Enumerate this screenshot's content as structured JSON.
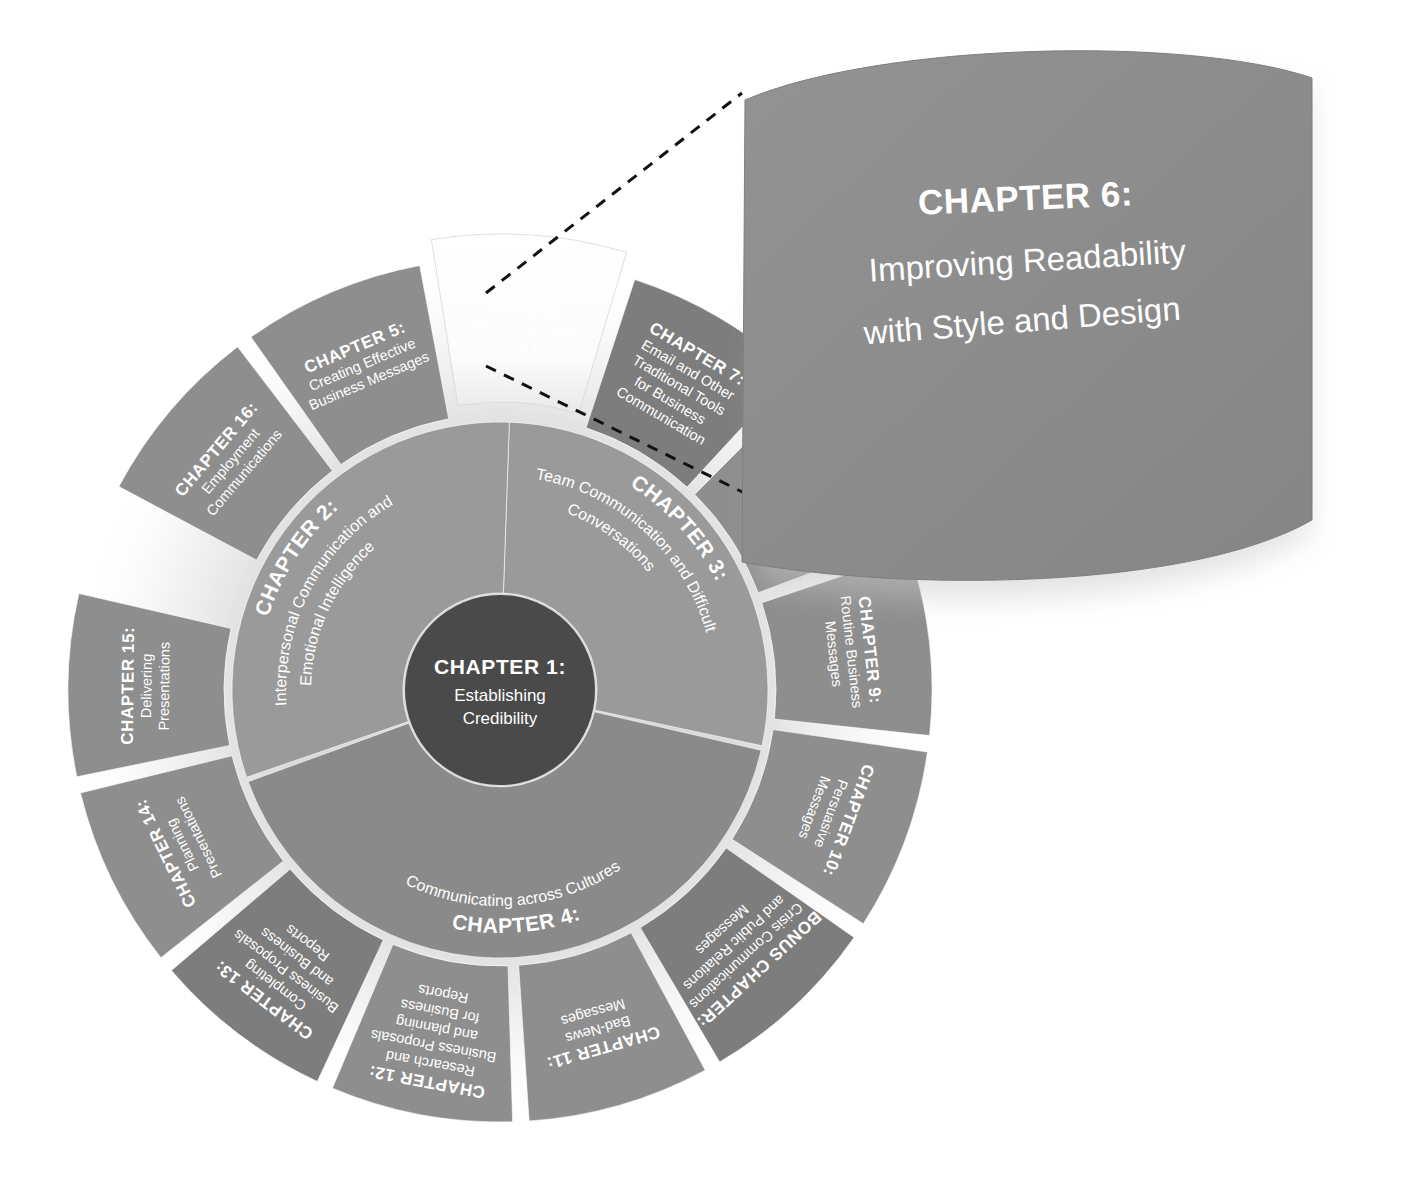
{
  "figure": {
    "type": "radial-chapter-wheel",
    "title_hidden": "Business Communication chapter wheel",
    "highlight_chapter": "CHAPTER 6",
    "colors": {
      "outer_ring": "#8e8e8e",
      "outer_ring_shade": "#7d7d7d",
      "inner_ring": "#9a9a9a",
      "inner_ring_shade": "#8a8a8a",
      "hub": "#4a4a4a",
      "highlight_fill": "#fdfdfd",
      "highlight_text": "#3b3b3b",
      "callout_fill": "#8e8e8e",
      "callout_text": "#ffffff",
      "leader_line": "#111111",
      "background": "#ffffff"
    }
  },
  "hub": {
    "number": "CHAPTER 1:",
    "lines": [
      "Establishing",
      "Credibility"
    ]
  },
  "inner_ring": [
    {
      "id": "ch3",
      "number": "CHAPTER 3:",
      "lines": [
        "Team Communication and Difficult",
        "Conversations"
      ],
      "start_angle": -12,
      "end_angle": 78
    },
    {
      "id": "ch4",
      "number": "CHAPTER 4:",
      "lines": [
        "Communicating across Cultures"
      ],
      "start_angle": 78,
      "end_angle": 182
    },
    {
      "id": "ch2",
      "number": "CHAPTER 2:",
      "lines": [
        "Interpersonal Communication and",
        "Emotional Intelligence"
      ],
      "start_angle": 182,
      "end_angle": 288
    }
  ],
  "outer_ring": [
    {
      "id": "ch5",
      "number": "CHAPTER 5:",
      "lines": [
        "Creating Effective",
        "Business Messages"
      ],
      "center_angle": 236
    },
    {
      "id": "ch6",
      "number": "CHAPTER 6:",
      "lines": [
        "Improving",
        "Readability with",
        "Style and Design"
      ],
      "center_angle": 268,
      "highlight": true
    },
    {
      "id": "ch7",
      "number": "CHAPTER 7:",
      "lines": [
        "Email and Other",
        "Traditional Tools",
        "for Business",
        "Communication"
      ],
      "center_angle": 300
    },
    {
      "id": "ch8",
      "number": "CHAPTER 8:",
      "lines": [
        "(obscured by callout)"
      ],
      "center_angle": 332,
      "obscured": true
    },
    {
      "id": "ch9",
      "number": "CHAPTER 9:",
      "lines": [
        "Routine Business",
        "Messages"
      ],
      "center_angle": 4
    },
    {
      "id": "ch10",
      "number": "CHAPTER 10:",
      "lines": [
        "Persuasive",
        "Messages"
      ],
      "center_angle": 36
    },
    {
      "id": "bonus",
      "number": "BONUS CHAPTER:",
      "lines": [
        "Crisis Communications",
        "and Public Relations",
        "Messages"
      ],
      "center_angle": 68
    },
    {
      "id": "ch11",
      "number": "CHAPTER 11:",
      "lines": [
        "Bad-News",
        "Messages"
      ],
      "center_angle": 100
    },
    {
      "id": "ch12",
      "number": "CHAPTER 12:",
      "lines": [
        "Research and",
        "Business Proposals",
        "and planning",
        "for Business",
        "Reports"
      ],
      "center_angle": 132
    },
    {
      "id": "ch13",
      "number": "CHAPTER 13:",
      "lines": [
        "Completing",
        "Business Proposals",
        "and Business",
        "Reports"
      ],
      "center_angle": 164
    },
    {
      "id": "ch14",
      "number": "CHAPTER 14:",
      "lines": [
        "Planning",
        "Presentations"
      ],
      "center_angle": 196
    },
    {
      "id": "ch15",
      "number": "CHAPTER 15:",
      "lines": [
        "Delivering",
        "Presentations"
      ],
      "center_angle": 214
    },
    {
      "id": "ch16",
      "number": "CHAPTER 16:",
      "lines": [
        "Employment",
        "Communications"
      ],
      "center_angle": 222
    }
  ],
  "callout": {
    "number": "CHAPTER 6:",
    "lines": [
      "Improving Readability",
      "with Style and Design"
    ]
  }
}
